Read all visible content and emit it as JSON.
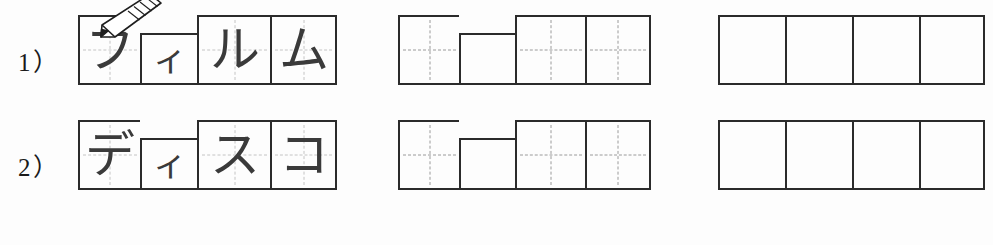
{
  "worksheet": {
    "title": "Katakana writing practice worksheet",
    "background_color": "#fdfdfd",
    "ink_color": "#2b2b2b",
    "guide_color": "#9a9a9a",
    "glyph_color": "#3a3a3a"
  },
  "rows": [
    {
      "label": "1）",
      "word_romaji": "firumu",
      "word_meaning": "film",
      "groups": [
        {
          "kind": "written",
          "name": "model-word",
          "cells": [
            {
              "text": "フ",
              "size": "tall",
              "guides": "faint"
            },
            {
              "text": "ィ",
              "size": "short",
              "guides": "none"
            },
            {
              "text": "ル",
              "size": "tall",
              "guides": "faint"
            },
            {
              "text": "ム",
              "size": "tall",
              "guides": "faint"
            }
          ]
        },
        {
          "kind": "guides",
          "name": "guided-practice",
          "cells": [
            {
              "text": "",
              "size": "tall",
              "guides": "dashed"
            },
            {
              "text": "",
              "size": "short",
              "guides": "none"
            },
            {
              "text": "",
              "size": "tall",
              "guides": "dashed"
            },
            {
              "text": "",
              "size": "tall",
              "guides": "dashed"
            }
          ]
        },
        {
          "kind": "blank",
          "name": "blank-practice",
          "cells": [
            {
              "text": "",
              "size": "tall",
              "guides": "none"
            },
            {
              "text": "",
              "size": "tall",
              "guides": "none"
            },
            {
              "text": "",
              "size": "tall",
              "guides": "none"
            },
            {
              "text": "",
              "size": "tall",
              "guides": "none"
            }
          ]
        }
      ]
    },
    {
      "label": "2）",
      "word_romaji": "disuko",
      "word_meaning": "disco",
      "groups": [
        {
          "kind": "written",
          "name": "model-word",
          "cells": [
            {
              "text": "デ",
              "size": "tall",
              "guides": "faint"
            },
            {
              "text": "ィ",
              "size": "short",
              "guides": "none"
            },
            {
              "text": "ス",
              "size": "tall",
              "guides": "faint"
            },
            {
              "text": "コ",
              "size": "tall",
              "guides": "faint"
            }
          ]
        },
        {
          "kind": "guides",
          "name": "guided-practice",
          "cells": [
            {
              "text": "",
              "size": "tall",
              "guides": "dashed"
            },
            {
              "text": "",
              "size": "short",
              "guides": "none"
            },
            {
              "text": "",
              "size": "tall",
              "guides": "dashed"
            },
            {
              "text": "",
              "size": "tall",
              "guides": "dashed"
            }
          ]
        },
        {
          "kind": "blank",
          "name": "blank-practice",
          "cells": [
            {
              "text": "",
              "size": "tall",
              "guides": "none"
            },
            {
              "text": "",
              "size": "tall",
              "guides": "none"
            },
            {
              "text": "",
              "size": "tall",
              "guides": "none"
            },
            {
              "text": "",
              "size": "tall",
              "guides": "none"
            }
          ]
        }
      ]
    }
  ],
  "pencil": {
    "icon": "pencil-icon",
    "on_row": 0,
    "on_cell": 0
  },
  "cell_widths": {
    "written": [
      62,
      57,
      73,
      67
    ],
    "guides": [
      61,
      56,
      70,
      66
    ],
    "blank": [
      67,
      67,
      67,
      66
    ]
  }
}
